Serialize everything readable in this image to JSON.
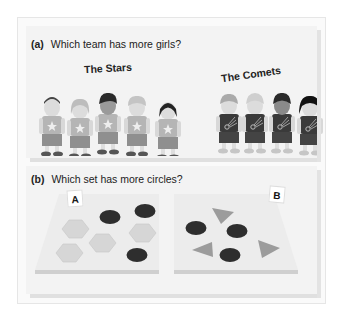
{
  "part_a": {
    "label": "(a)",
    "question": "Which team has more girls?",
    "teams": [
      {
        "name": "The Stars",
        "members": [
          "boy",
          "girl",
          "boy",
          "boy",
          "girl"
        ],
        "shirt_icon": "star-icon"
      },
      {
        "name": "The Comets",
        "members": [
          "boy",
          "boy",
          "boy",
          "girl"
        ],
        "shirt_icon": "comet-icon"
      }
    ]
  },
  "part_b": {
    "label": "(b)",
    "question": "Which set has more circles?",
    "sets": [
      {
        "name": "A",
        "circles": 3,
        "hexagons": 5
      },
      {
        "name": "B",
        "circles": 3,
        "triangles": 3
      }
    ]
  },
  "colors": {
    "panel_bg": "#f3f3f3",
    "dark_piece": "#2e2e2e",
    "light_piece": "#d4d4d4",
    "stars_shirt": "#b5b5b5",
    "comets_shirt": "#3a3a3a"
  }
}
